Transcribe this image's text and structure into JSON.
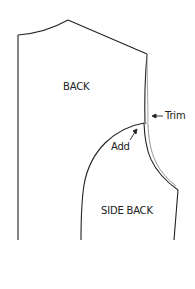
{
  "diagram": {
    "type": "sewing-pattern",
    "labels": {
      "back": "BACK",
      "side_back": "SIDE BACK",
      "trim": "Trim",
      "add": "Add"
    },
    "colors": {
      "line": "#222222",
      "trim_line": "#9a9a9a",
      "background": "#ffffff"
    }
  }
}
